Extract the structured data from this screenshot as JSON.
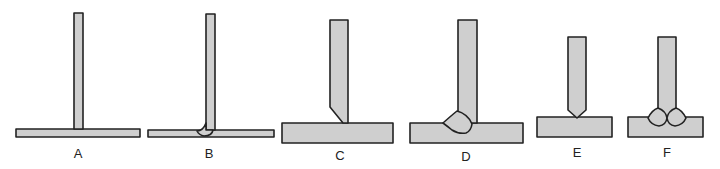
{
  "diagram": {
    "type": "welded T-joint preparation sequence",
    "colors": {
      "fill": "#cfcfcf",
      "stroke": "#222222",
      "background": "#ffffff"
    },
    "figures": [
      {
        "id": "A",
        "label": "A",
        "description": "Thin square-edged T joint, no weld"
      },
      {
        "id": "B",
        "label": "B",
        "description": "Thin T joint with single fillet weld on left side"
      },
      {
        "id": "C",
        "label": "C",
        "description": "Thick T joint with single bevel on vertical member"
      },
      {
        "id": "D",
        "label": "D",
        "description": "Thick single-bevel T joint with weld deposited"
      },
      {
        "id": "E",
        "label": "E",
        "description": "T joint with double bevel (pointed) vertical member"
      },
      {
        "id": "F",
        "label": "F",
        "description": "Double-bevel T joint with welds on both sides"
      }
    ]
  }
}
